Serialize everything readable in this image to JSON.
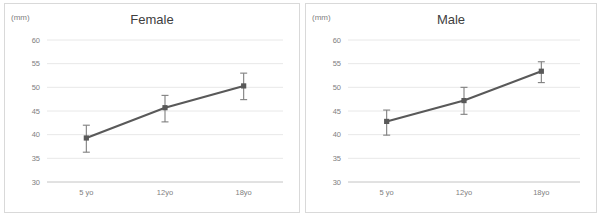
{
  "figure": {
    "panels": [
      "female",
      "male"
    ]
  },
  "chart_data": [
    {
      "type": "line",
      "title": "Female",
      "xlabel": "",
      "ylabel": "(mm)",
      "categories": [
        "5 yo",
        "12yo",
        "18yo"
      ],
      "values": [
        39.3,
        45.7,
        50.3
      ],
      "error_upper": [
        42.0,
        48.3,
        53.0
      ],
      "error_lower": [
        36.3,
        42.7,
        47.4
      ],
      "yticks": [
        30,
        35,
        40,
        45,
        50,
        55,
        60
      ],
      "ylim": [
        30,
        60
      ],
      "grid": true,
      "legend": "none",
      "marker": "square",
      "line_color": "#595959",
      "error_color": "#7f7f7f",
      "grid_color": "#e8e8e8"
    },
    {
      "type": "line",
      "title": "Male",
      "xlabel": "",
      "ylabel": "(mm)",
      "categories": [
        "5 yo",
        "12yo",
        "18yo"
      ],
      "values": [
        42.8,
        47.2,
        53.4
      ],
      "error_upper": [
        45.2,
        50.0,
        55.4
      ],
      "error_lower": [
        39.9,
        44.3,
        51.0
      ],
      "yticks": [
        30,
        35,
        40,
        45,
        50,
        55,
        60
      ],
      "ylim": [
        30,
        60
      ],
      "grid": true,
      "legend": "none",
      "marker": "square",
      "line_color": "#595959",
      "error_color": "#7f7f7f",
      "grid_color": "#e8e8e8"
    }
  ]
}
